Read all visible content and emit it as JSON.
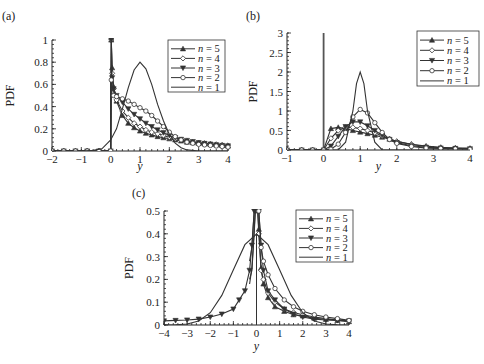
{
  "chart_data": [
    {
      "panel": "(a)",
      "type": "line",
      "xlabel": "y",
      "ylabel": "PDF",
      "xlim": [
        -2,
        4
      ],
      "ylim": [
        0,
        1
      ],
      "xticks": [
        "-2",
        "-1",
        "0",
        "1",
        "2",
        "3",
        "4"
      ],
      "yticks": [
        "0",
        "0.2",
        "0.4",
        "0.6",
        "0.8",
        "1"
      ],
      "legend": [
        "n = 5",
        "n = 4",
        "n = 3",
        "n = 2",
        "n = 1"
      ],
      "legend_position": "upper right",
      "series": [
        {
          "name": "n = 5",
          "marker": "triangle-up",
          "x": [
            -2,
            -1.6,
            -1.2,
            -0.8,
            -0.4,
            0,
            0.02,
            0.05,
            0.1,
            0.2,
            0.4,
            0.6,
            0.8,
            1,
            1.2,
            1.4,
            1.6,
            1.8,
            2,
            2.2,
            2.4,
            2.6,
            2.8,
            3,
            3.2,
            3.4,
            3.6,
            3.8,
            4
          ],
          "y": [
            0,
            0,
            0,
            0,
            0,
            0,
            1.0,
            0.75,
            0.58,
            0.45,
            0.32,
            0.25,
            0.21,
            0.18,
            0.16,
            0.145,
            0.13,
            0.12,
            0.11,
            0.1,
            0.09,
            0.08,
            0.075,
            0.07,
            0.065,
            0.06,
            0.055,
            0.05,
            0.045
          ]
        },
        {
          "name": "n = 4",
          "marker": "diamond",
          "x": [
            -2,
            -1.6,
            -1.2,
            -0.8,
            -0.4,
            0,
            0.02,
            0.05,
            0.1,
            0.2,
            0.4,
            0.6,
            0.8,
            1,
            1.2,
            1.4,
            1.6,
            1.8,
            2,
            2.2,
            2.4,
            2.6,
            2.8,
            3,
            3.2,
            3.4,
            3.6,
            3.8,
            4
          ],
          "y": [
            0,
            0,
            0,
            0,
            0,
            0,
            1.0,
            0.7,
            0.56,
            0.46,
            0.36,
            0.3,
            0.25,
            0.22,
            0.19,
            0.17,
            0.155,
            0.14,
            0.125,
            0.11,
            0.1,
            0.09,
            0.08,
            0.075,
            0.07,
            0.065,
            0.06,
            0.055,
            0.05
          ]
        },
        {
          "name": "n = 3",
          "marker": "triangle-down",
          "x": [
            -2,
            -1.6,
            -1.2,
            -0.8,
            -0.4,
            0,
            0.02,
            0.05,
            0.1,
            0.2,
            0.4,
            0.6,
            0.8,
            1,
            1.2,
            1.4,
            1.6,
            1.8,
            2,
            2.2,
            2.4,
            2.6,
            2.8,
            3,
            3.2,
            3.4,
            3.6,
            3.8,
            4
          ],
          "y": [
            0,
            0,
            0,
            0,
            0,
            0,
            1.0,
            0.66,
            0.56,
            0.5,
            0.44,
            0.38,
            0.33,
            0.29,
            0.25,
            0.22,
            0.19,
            0.165,
            0.14,
            0.12,
            0.105,
            0.095,
            0.085,
            0.075,
            0.068,
            0.062,
            0.056,
            0.05,
            0.046
          ]
        },
        {
          "name": "n = 2",
          "marker": "circle",
          "x": [
            -2,
            -1.6,
            -1.2,
            -0.8,
            -0.4,
            0,
            0.02,
            0.1,
            0.2,
            0.4,
            0.6,
            0.8,
            1,
            1.2,
            1.4,
            1.6,
            1.8,
            2,
            2.2,
            2.4,
            2.6,
            2.8,
            3,
            3.2,
            3.4,
            3.6,
            3.8,
            4
          ],
          "y": [
            0,
            0,
            0,
            0,
            0,
            0,
            0.64,
            0.5,
            0.49,
            0.47,
            0.45,
            0.42,
            0.39,
            0.36,
            0.32,
            0.27,
            0.22,
            0.17,
            0.13,
            0.1,
            0.08,
            0.07,
            0.06,
            0.055,
            0.05,
            0.045,
            0.04,
            0.035
          ]
        },
        {
          "name": "n = 1",
          "marker": "none",
          "x": [
            -2,
            -1,
            -0.6,
            -0.3,
            0,
            0.2,
            0.4,
            0.6,
            0.8,
            1,
            1.2,
            1.4,
            1.6,
            1.8,
            2,
            2.2,
            2.4,
            2.6,
            3,
            4
          ],
          "y": [
            0,
            0,
            0.005,
            0.02,
            0.1,
            0.2,
            0.38,
            0.57,
            0.73,
            0.8,
            0.74,
            0.6,
            0.42,
            0.27,
            0.15,
            0.07,
            0.03,
            0.01,
            0,
            0
          ]
        }
      ]
    },
    {
      "panel": "(b)",
      "type": "line",
      "xlabel": "y",
      "ylabel": "PDF",
      "xlim": [
        -1,
        4
      ],
      "ylim": [
        0,
        3
      ],
      "xticks": [
        "-1",
        "0",
        "1",
        "2",
        "3",
        "4"
      ],
      "yticks": [
        "0",
        "0.5",
        "1",
        "1.5",
        "2",
        "2.5",
        "3"
      ],
      "legend": [
        "n = 5",
        "n = 4",
        "n = 3",
        "n = 2",
        "n = 1"
      ],
      "legend_position": "upper right",
      "annotations": [
        "Vertical spike (delta) at y = 0 for n = 1"
      ],
      "series": [
        {
          "name": "n = 5",
          "marker": "triangle-up",
          "x": [
            -1,
            -0.6,
            -0.3,
            0,
            0.2,
            0.4,
            0.6,
            0.8,
            1,
            1.2,
            1.4,
            1.6,
            1.8,
            2,
            2.4,
            2.8,
            3.2,
            3.6,
            4
          ],
          "y": [
            0,
            0,
            0,
            0,
            0.55,
            0.58,
            0.55,
            0.5,
            0.46,
            0.42,
            0.38,
            0.33,
            0.28,
            0.22,
            0.15,
            0.1,
            0.07,
            0.05,
            0.04
          ]
        },
        {
          "name": "n = 4",
          "marker": "diamond",
          "x": [
            -1,
            -0.6,
            -0.3,
            0,
            0.2,
            0.4,
            0.6,
            0.8,
            1,
            1.2,
            1.4,
            1.6,
            1.8,
            2,
            2.4,
            2.8,
            3.2,
            3.6,
            4
          ],
          "y": [
            0,
            0,
            0,
            0,
            0.3,
            0.5,
            0.58,
            0.58,
            0.55,
            0.5,
            0.44,
            0.36,
            0.29,
            0.22,
            0.14,
            0.09,
            0.06,
            0.05,
            0.04
          ]
        },
        {
          "name": "n = 3",
          "marker": "triangle-down",
          "x": [
            -1,
            -0.6,
            -0.3,
            0,
            0.2,
            0.4,
            0.6,
            0.8,
            1,
            1.2,
            1.4,
            1.6,
            1.8,
            2,
            2.4,
            2.8,
            3.2,
            3.6,
            4
          ],
          "y": [
            0,
            0,
            0,
            0,
            0.1,
            0.35,
            0.6,
            0.72,
            0.72,
            0.62,
            0.5,
            0.38,
            0.27,
            0.19,
            0.11,
            0.07,
            0.05,
            0.04,
            0.03
          ]
        },
        {
          "name": "n = 2",
          "marker": "circle",
          "x": [
            -1,
            -0.6,
            -0.3,
            0,
            0.2,
            0.4,
            0.6,
            0.8,
            1,
            1.2,
            1.4,
            1.6,
            1.8,
            2,
            2.4,
            2.8,
            3.2,
            3.6,
            4
          ],
          "y": [
            0,
            0,
            0,
            0,
            0.02,
            0.15,
            0.45,
            0.85,
            1.04,
            0.95,
            0.7,
            0.45,
            0.27,
            0.17,
            0.09,
            0.05,
            0.04,
            0.03,
            0.02
          ]
        },
        {
          "name": "n = 1",
          "marker": "none",
          "x": [
            -1,
            0,
            0.4,
            0.6,
            0.8,
            0.9,
            1,
            1.1,
            1.2,
            1.4,
            1.6,
            2,
            4
          ],
          "y": [
            0,
            0,
            0,
            0.2,
            1.0,
            1.7,
            2.0,
            1.7,
            1.0,
            0.2,
            0,
            0,
            0
          ]
        }
      ]
    },
    {
      "panel": "(c)",
      "type": "line",
      "xlabel": "y",
      "ylabel": "PDF",
      "xlim": [
        -4,
        4
      ],
      "ylim": [
        0,
        0.5
      ],
      "xticks": [
        "-4",
        "-3",
        "-2",
        "-1",
        "0",
        "1",
        "2",
        "3",
        "4"
      ],
      "yticks": [
        "0",
        "0.1",
        "0.2",
        "0.3",
        "0.4",
        "0.5"
      ],
      "legend": [
        "n = 5",
        "n = 4",
        "n = 3",
        "n = 2",
        "n = 1"
      ],
      "legend_position": "upper right",
      "series": [
        {
          "name": "n = 5",
          "marker": "triangle-up",
          "x": [
            0.05,
            0.1,
            0.2,
            0.3,
            0.5,
            0.8,
            1.2,
            1.6,
            2,
            2.5,
            3,
            3.5,
            4
          ],
          "y": [
            0.5,
            0.42,
            0.25,
            0.18,
            0.12,
            0.08,
            0.06,
            0.045,
            0.04,
            0.03,
            0.025,
            0.02,
            0.015
          ]
        },
        {
          "name": "n = 4",
          "marker": "diamond",
          "x": [
            0.05,
            0.1,
            0.2,
            0.3,
            0.5,
            0.8,
            1.2,
            1.6,
            2,
            2.5,
            3,
            3.5,
            4
          ],
          "y": [
            0.5,
            0.4,
            0.24,
            0.2,
            0.14,
            0.1,
            0.07,
            0.055,
            0.045,
            0.035,
            0.028,
            0.022,
            0.018
          ]
        },
        {
          "name": "n = 3",
          "marker": "triangle-down",
          "x": [
            -4,
            -3.5,
            -3,
            -2.5,
            -2,
            -1.5,
            -1,
            -0.75,
            -0.5,
            -0.3,
            -0.2,
            -0.1,
            0.1,
            0.2,
            0.3,
            0.5,
            0.8,
            1.2,
            1.6,
            2,
            2.5,
            3,
            3.5,
            4
          ],
          "y": [
            0.018,
            0.02,
            0.022,
            0.026,
            0.035,
            0.048,
            0.07,
            0.11,
            0.15,
            0.24,
            0.35,
            0.5,
            0.5,
            0.35,
            0.24,
            0.15,
            0.11,
            0.07,
            0.048,
            0.035,
            0.026,
            0.022,
            0.02,
            0.018
          ]
        },
        {
          "name": "n = 2",
          "marker": "circle",
          "x": [
            0.1,
            0.2,
            0.3,
            0.5,
            0.8,
            1.2,
            1.6,
            2,
            2.5,
            3,
            3.5,
            4
          ],
          "y": [
            0.5,
            0.34,
            0.28,
            0.22,
            0.16,
            0.11,
            0.08,
            0.06,
            0.045,
            0.035,
            0.028,
            0.02
          ]
        },
        {
          "name": "n = 1",
          "marker": "none",
          "x": [
            -4,
            -3.5,
            -3,
            -2.5,
            -2,
            -1.5,
            -1,
            -0.5,
            0,
            0.5,
            1,
            1.5,
            2,
            2.5,
            3,
            3.5,
            4
          ],
          "y": [
            0.0001,
            0.0009,
            0.0044,
            0.0175,
            0.054,
            0.13,
            0.242,
            0.352,
            0.399,
            0.352,
            0.242,
            0.13,
            0.054,
            0.0175,
            0.0044,
            0.0009,
            0.0001
          ]
        }
      ]
    }
  ],
  "panels": {
    "a": {
      "label": "(a)",
      "ylabel": "PDF",
      "xlabel": "y"
    },
    "b": {
      "label": "(b)",
      "ylabel": "PDF",
      "xlabel": "y"
    },
    "c": {
      "label": "(c)",
      "ylabel": "PDF",
      "xlabel": "y"
    }
  }
}
